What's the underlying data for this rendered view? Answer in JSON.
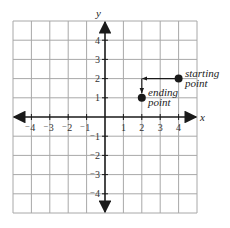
{
  "diagram": {
    "type": "coordinate-grid",
    "x_axis_label": "x",
    "y_axis_label": "y",
    "x_range": [
      -5,
      5
    ],
    "y_range": [
      -5,
      5
    ],
    "x_tick_labels": [
      "⁻4",
      "⁻3",
      "⁻2",
      "⁻1",
      "1",
      "2",
      "3",
      "4"
    ],
    "y_tick_labels": [
      "4",
      "3",
      "2",
      "1",
      "⁻1",
      "⁻2",
      "⁻3",
      "⁻4"
    ],
    "points": [
      {
        "name": "starting-point",
        "x": 4,
        "y": 2,
        "label_line1": "starting",
        "label_line2": "point"
      },
      {
        "name": "ending-point",
        "x": 2,
        "y": 1,
        "label_line1": "ending",
        "label_line2": "point"
      }
    ],
    "path": [
      [
        4,
        2
      ],
      [
        2,
        2
      ],
      [
        2,
        1
      ]
    ],
    "colors": {
      "grid": "#a8a8a8",
      "axis": "#1a1a1a",
      "point": "#1a1a1a"
    }
  }
}
